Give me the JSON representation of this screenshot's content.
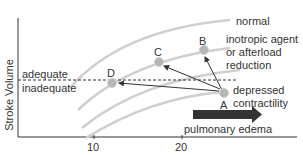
{
  "diagram": {
    "title": "",
    "y_axis_label": "Stroke Volume",
    "x_ticks": [
      "10",
      "20"
    ],
    "threshold": {
      "above_label": "adequate",
      "below_label": "inadequate"
    },
    "curves": [
      {
        "id": "normal",
        "label": "normal"
      },
      {
        "id": "inotropic",
        "label_lines": [
          "inotropic agent",
          "or afterload",
          "reduction"
        ]
      },
      {
        "id": "mid",
        "label": ""
      },
      {
        "id": "depressed",
        "label_lines": [
          "depressed",
          "contractility"
        ]
      }
    ],
    "points": [
      {
        "id": "A",
        "label": "A"
      },
      {
        "id": "B",
        "label": "B"
      },
      {
        "id": "C",
        "label": "C"
      },
      {
        "id": "D",
        "label": "D"
      }
    ],
    "arrow_label": "pulmonary edema",
    "colors": {
      "curve": "#cfcfcf",
      "point": "#b5b5b5",
      "axis": "#333333",
      "arrow": "#333333",
      "band": "#333333"
    }
  }
}
